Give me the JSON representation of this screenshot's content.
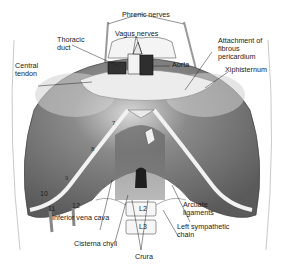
{
  "figure": {
    "colors": {
      "muscle": "#6e6e6e",
      "muscle_dark": "#3c3c3c",
      "tendon": "#e6e6e6",
      "line": "#222222",
      "background": "#ffffff"
    }
  },
  "labels": {
    "phrenic_nerves": "Phrenic nerves",
    "vagus_nerves": "Vagus nerves",
    "thoracic_duct": "Thoracic\nduct",
    "attachment_fibrous_pericardium": "Attachment of\nfibrous\npericardium",
    "aorta": "Aorta",
    "xiphisternum": "Xiphisternum",
    "central_tendon": "Central\ntendon",
    "inferior_vena_cava": "Inferior vena cava",
    "arcuate_ligaments": "Arcuate\nligaments",
    "left_sympathetic_chain": "Left sympathetic\nchain",
    "cisterna_chyli": "Cisterna chyli",
    "crura": "Crura"
  },
  "ribs": [
    "7",
    "8",
    "9",
    "10",
    "11",
    "12"
  ],
  "vertebrae": [
    "L2",
    "L3"
  ]
}
